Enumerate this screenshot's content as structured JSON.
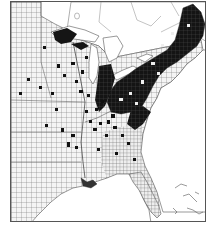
{
  "map": {
    "type": "choropleth",
    "subject": "county-level distribution, eastern United States",
    "style": "black-and-white scanned print",
    "colors": {
      "background": "#ffffff",
      "land_fill": "#f2f2f2",
      "county_lines": "#6a6a6a",
      "shaded_counties": "#111111",
      "water": "#ffffff",
      "frame": "#555555"
    },
    "regions_shaded_heavy": [
      "Maine",
      "New Hampshire",
      "Vermont",
      "Massachusetts",
      "New York",
      "Pennsylvania",
      "Ohio",
      "northern Michigan (Upper Peninsula)",
      "eastern Indiana",
      "Maryland",
      "New Jersey"
    ],
    "regions_shaded_scattered": [
      "Wisconsin",
      "Iowa",
      "Illinois",
      "Missouri",
      "Kansas",
      "Kentucky",
      "Tennessee",
      "Arkansas",
      "Louisiana",
      "Virginia",
      "North Carolina",
      "Alabama",
      "Georgia"
    ],
    "features_visible": [
      "Great Lakes",
      "Gulf of Mexico",
      "Atlantic Ocean",
      "Florida peninsula",
      "Bahamas islands",
      "Canadian provinces (unshaded outline)"
    ],
    "legend": null,
    "title": null
  }
}
